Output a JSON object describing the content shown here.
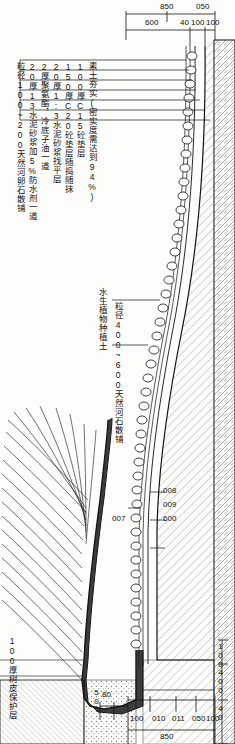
{
  "diagram": {
    "layer_notes": [
      "粒径100~200天然河卵石散铺",
      "20厚13水泥砂浆加5%防水剂一道",
      "2厚聚氨酯，冷底子油一道",
      "20厚1:3水泥砂浆找平层",
      "150厚C20砼垫层随捣随抹",
      "100厚C15砼垫层",
      "素土夯实(密实度需达到94%)"
    ],
    "mid_notes": [
      "水生植物种植土",
      "粒径400~600天然河石散铺"
    ],
    "bottom_note": "100厚树皮保护层",
    "dimensions": {
      "top_group": [
        "850",
        "050",
        "600",
        "100",
        "40",
        "100"
      ],
      "right_group": [
        "100",
        "400",
        "40"
      ],
      "bottom_group": [
        "100",
        "010",
        "011",
        "050",
        "100"
      ],
      "bottom_total": "850",
      "bottom_small": [
        "50",
        "80"
      ],
      "interior": [
        "008",
        "009",
        "007",
        "600"
      ]
    }
  }
}
